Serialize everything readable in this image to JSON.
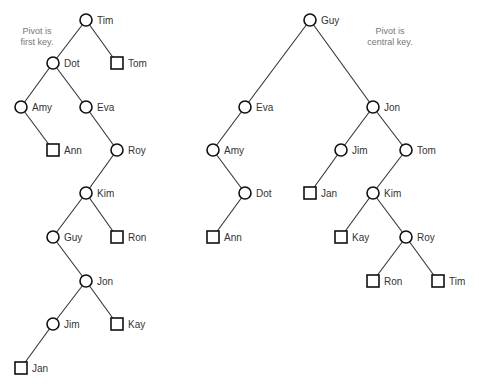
{
  "diagram": {
    "type": "binary-search-trees",
    "node_radius": 6,
    "leaf_size": 12,
    "trees": [
      {
        "id": "first-key-tree",
        "annotation": {
          "lines": [
            "Pivot is",
            "first key."
          ],
          "x": 37,
          "y": 34
        },
        "nodes": [
          {
            "id": "Tim",
            "label": "Tim",
            "kind": "internal",
            "x": 86,
            "y": 20
          },
          {
            "id": "Dot",
            "label": "Dot",
            "kind": "internal",
            "x": 53,
            "y": 63
          },
          {
            "id": "Tom",
            "label": "Tom",
            "kind": "leaf",
            "x": 117,
            "y": 63
          },
          {
            "id": "Amy",
            "label": "Amy",
            "kind": "internal",
            "x": 21,
            "y": 107
          },
          {
            "id": "Eva",
            "label": "Eva",
            "kind": "internal",
            "x": 86,
            "y": 107
          },
          {
            "id": "Ann",
            "label": "Ann",
            "kind": "leaf",
            "x": 53,
            "y": 150
          },
          {
            "id": "Roy",
            "label": "Roy",
            "kind": "internal",
            "x": 117,
            "y": 150
          },
          {
            "id": "Kim",
            "label": "Kim",
            "kind": "internal",
            "x": 86,
            "y": 193
          },
          {
            "id": "Guy",
            "label": "Guy",
            "kind": "internal",
            "x": 53,
            "y": 237
          },
          {
            "id": "Ron",
            "label": "Ron",
            "kind": "leaf",
            "x": 117,
            "y": 237
          },
          {
            "id": "Jon",
            "label": "Jon",
            "kind": "internal",
            "x": 86,
            "y": 281
          },
          {
            "id": "Jim",
            "label": "Jim",
            "kind": "internal",
            "x": 53,
            "y": 324
          },
          {
            "id": "Kay",
            "label": "Kay",
            "kind": "leaf",
            "x": 117,
            "y": 324
          },
          {
            "id": "Jan",
            "label": "Jan",
            "kind": "leaf",
            "x": 21,
            "y": 368
          }
        ],
        "edges": [
          [
            "Tim",
            "Dot"
          ],
          [
            "Tim",
            "Tom"
          ],
          [
            "Dot",
            "Amy"
          ],
          [
            "Dot",
            "Eva"
          ],
          [
            "Amy",
            "Ann"
          ],
          [
            "Eva",
            "Roy"
          ],
          [
            "Roy",
            "Kim"
          ],
          [
            "Kim",
            "Guy"
          ],
          [
            "Kim",
            "Ron"
          ],
          [
            "Guy",
            "Jon"
          ],
          [
            "Jon",
            "Jim"
          ],
          [
            "Jon",
            "Kay"
          ],
          [
            "Jim",
            "Jan"
          ]
        ]
      },
      {
        "id": "central-key-tree",
        "annotation": {
          "lines": [
            "Pivot is",
            "central key."
          ],
          "x": 390,
          "y": 34
        },
        "nodes": [
          {
            "id": "Guy",
            "label": "Guy",
            "kind": "internal",
            "x": 310,
            "y": 20
          },
          {
            "id": "Eva",
            "label": "Eva",
            "kind": "internal",
            "x": 245,
            "y": 107
          },
          {
            "id": "Jon",
            "label": "Jon",
            "kind": "internal",
            "x": 373,
            "y": 107
          },
          {
            "id": "Amy",
            "label": "Amy",
            "kind": "internal",
            "x": 213,
            "y": 150
          },
          {
            "id": "Jim",
            "label": "Jim",
            "kind": "internal",
            "x": 341,
            "y": 150
          },
          {
            "id": "Tom",
            "label": "Tom",
            "kind": "internal",
            "x": 406,
            "y": 150
          },
          {
            "id": "Dot",
            "label": "Dot",
            "kind": "internal",
            "x": 245,
            "y": 193
          },
          {
            "id": "Jan",
            "label": "Jan",
            "kind": "leaf",
            "x": 310,
            "y": 193
          },
          {
            "id": "Kim",
            "label": "Kim",
            "kind": "internal",
            "x": 373,
            "y": 193
          },
          {
            "id": "Ann",
            "label": "Ann",
            "kind": "leaf",
            "x": 213,
            "y": 237
          },
          {
            "id": "Kay",
            "label": "Kay",
            "kind": "leaf",
            "x": 341,
            "y": 237
          },
          {
            "id": "Roy",
            "label": "Roy",
            "kind": "internal",
            "x": 406,
            "y": 237
          },
          {
            "id": "Ron",
            "label": "Ron",
            "kind": "leaf",
            "x": 373,
            "y": 281
          },
          {
            "id": "Tim",
            "label": "Tim",
            "kind": "leaf",
            "x": 438,
            "y": 281
          }
        ],
        "edges": [
          [
            "Guy",
            "Eva"
          ],
          [
            "Guy",
            "Jon"
          ],
          [
            "Eva",
            "Amy"
          ],
          [
            "Amy",
            "Dot"
          ],
          [
            "Dot",
            "Ann"
          ],
          [
            "Jon",
            "Jim"
          ],
          [
            "Jon",
            "Tom"
          ],
          [
            "Jim",
            "Jan"
          ],
          [
            "Tom",
            "Kim"
          ],
          [
            "Kim",
            "Kay"
          ],
          [
            "Kim",
            "Roy"
          ],
          [
            "Roy",
            "Ron"
          ],
          [
            "Roy",
            "Tim"
          ]
        ]
      }
    ]
  }
}
